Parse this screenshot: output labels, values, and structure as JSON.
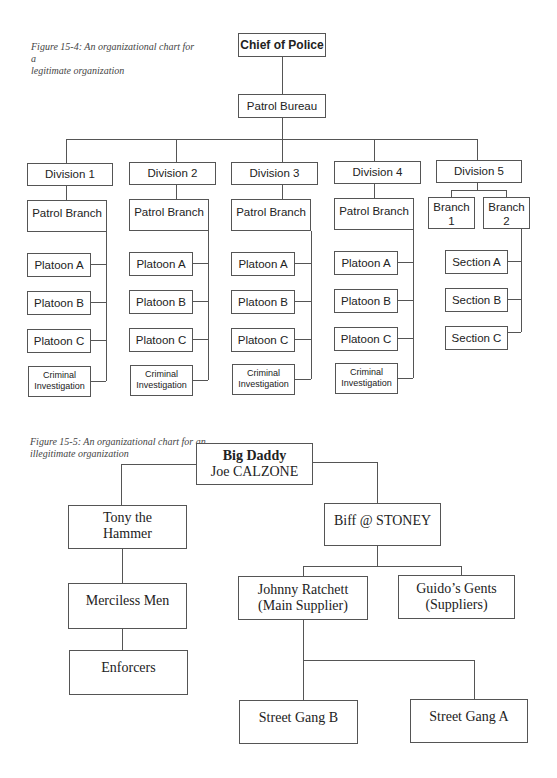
{
  "figure1": {
    "caption_line1": "Figure 15-4: An organizational chart for a",
    "caption_line2": "legitimate organization",
    "chief": "Chief of Police",
    "bureau": "Patrol Bureau",
    "divisions": [
      {
        "name": "Division 1",
        "branch": "Patrol Branch",
        "units": [
          "Platoon A",
          "Platoon B",
          "Platoon C"
        ],
        "ci1": "Criminal",
        "ci2": "Investigation"
      },
      {
        "name": "Division 2",
        "branch": "Patrol Branch",
        "units": [
          "Platoon A",
          "Platoon B",
          "Platoon C"
        ],
        "ci1": "Criminal",
        "ci2": "Investigation"
      },
      {
        "name": "Division 3",
        "branch": "Patrol Branch",
        "units": [
          "Platoon A",
          "Platoon B",
          "Platoon C"
        ],
        "ci1": "Criminal",
        "ci2": "Investigation"
      },
      {
        "name": "Division 4",
        "branch": "Patrol Branch",
        "units": [
          "Platoon A",
          "Platoon B",
          "Platoon C"
        ],
        "ci1": "Criminal",
        "ci2": "Investigation"
      }
    ],
    "division5": {
      "name": "Division 5",
      "branch1_a": "Branch",
      "branch1_b": "1",
      "branch2_a": "Branch",
      "branch2_b": "2",
      "sections": [
        "Section A",
        "Section B",
        "Section C"
      ]
    }
  },
  "figure2": {
    "caption_line1": "Figure 15-5: An organizational chart for an",
    "caption_line2": "illegitimate organization",
    "boss_title": "Big Daddy",
    "boss_name": "Joe CALZONE",
    "tony_a": "Tony the",
    "tony_b": "Hammer",
    "merciless": "Merciless Men",
    "enforcers": "Enforcers",
    "biff": "Biff @ STONEY",
    "johnny_a": "Johnny Ratchett",
    "johnny_b": "(Main Supplier)",
    "guido_a": "Guido’s Gents",
    "guido_b": "(Suppliers)",
    "gang_b": "Street Gang B",
    "gang_a": "Street Gang A"
  }
}
